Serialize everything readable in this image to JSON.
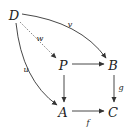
{
  "diagram": {
    "type": "commutative-diagram-pullback",
    "nodes": {
      "D": {
        "label": "D",
        "x": 14,
        "y": 15
      },
      "P": {
        "label": "P",
        "x": 63,
        "y": 66
      },
      "B": {
        "label": "B",
        "x": 113,
        "y": 66
      },
      "A": {
        "label": "A",
        "x": 63,
        "y": 112
      },
      "C": {
        "label": "C",
        "x": 113,
        "y": 112
      }
    },
    "arrows": [
      {
        "from": "D",
        "to": "B",
        "label": "v",
        "style": "solid",
        "curved": true
      },
      {
        "from": "D",
        "to": "P",
        "label": "w",
        "style": "dotted",
        "curved": false
      },
      {
        "from": "D",
        "to": "A",
        "label": "u",
        "style": "solid",
        "curved": true
      },
      {
        "from": "P",
        "to": "B",
        "label": "",
        "style": "solid",
        "curved": false
      },
      {
        "from": "P",
        "to": "A",
        "label": "",
        "style": "solid",
        "curved": false
      },
      {
        "from": "B",
        "to": "C",
        "label": "g",
        "style": "solid",
        "curved": false
      },
      {
        "from": "A",
        "to": "C",
        "label": "f",
        "style": "solid",
        "curved": false
      }
    ],
    "labels": {
      "v": "v",
      "w": "w",
      "u": "u",
      "g": "g",
      "f": "f"
    },
    "colors": {
      "stroke": "#333333",
      "text": "#222222"
    }
  }
}
